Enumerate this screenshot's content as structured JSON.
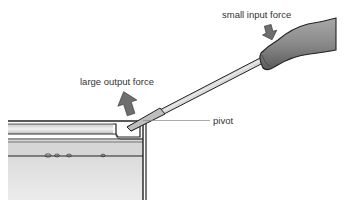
{
  "diagram": {
    "labels": {
      "input_force": "small input force",
      "output_force": "large output force",
      "pivot": "pivot"
    },
    "colors": {
      "background": "#ffffff",
      "arrow": "#6e6e6e",
      "handle": "#8a8a8a",
      "shaft": "#d9d9d9",
      "outline": "#222222",
      "tin_body": "#ececec",
      "tin_band": "#d4d4d4",
      "text": "#333333",
      "leader_line": "#888888"
    }
  }
}
